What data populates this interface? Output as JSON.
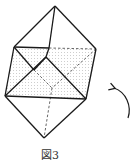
{
  "figure": {
    "caption": "図3",
    "stroke_color": "#1a1a1a",
    "dash_color": "#555555",
    "shade_color": "#d8d8d8",
    "vertices": {
      "T": [
        55,
        6
      ],
      "A": [
        14,
        47
      ],
      "M": [
        49,
        48
      ],
      "B": [
        96,
        49
      ],
      "F": [
        46,
        57
      ],
      "G": [
        34,
        70
      ],
      "H": [
        52,
        88
      ],
      "C": [
        5,
        96
      ],
      "D": [
        86,
        99
      ],
      "E": [
        44,
        138
      ]
    },
    "solid_edges": [
      [
        "T",
        "A"
      ],
      [
        "T",
        "B"
      ],
      [
        "T",
        "M"
      ],
      [
        "M",
        "F"
      ],
      [
        "A",
        "M"
      ],
      [
        "A",
        "G"
      ],
      [
        "G",
        "F"
      ],
      [
        "A",
        "C"
      ],
      [
        "C",
        "F"
      ],
      [
        "F",
        "D"
      ],
      [
        "C",
        "D"
      ],
      [
        "B",
        "D"
      ],
      [
        "C",
        "E"
      ],
      [
        "D",
        "E"
      ]
    ],
    "dashed_edges": [
      [
        "M",
        "B"
      ],
      [
        "G",
        "H"
      ],
      [
        "B",
        "H"
      ],
      [
        "H",
        "E"
      ]
    ],
    "arrow": {
      "direction": "counterclockwise",
      "label": "rotation-arrow"
    }
  }
}
